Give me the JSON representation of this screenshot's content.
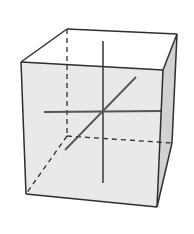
{
  "diagram": {
    "title": "",
    "colors": {
      "background": "#ffffff",
      "front_face": "#e9e9e9",
      "side_face": "#d2d2d2",
      "top_face": "#ffffff",
      "edge": "#2e2e2e",
      "axis": "#555555"
    },
    "vertices": {
      "front_top_left": [
        21,
        62
      ],
      "front_top_right": [
        163,
        70
      ],
      "front_bottom_right": [
        157,
        207
      ],
      "front_bottom_left": [
        26,
        194
      ],
      "back_top_left": [
        67,
        29
      ],
      "back_top_right": [
        177,
        34
      ],
      "back_bottom_right": [
        172,
        143
      ],
      "back_bottom_left": [
        67,
        136
      ]
    },
    "axes": [
      {
        "name": "vertical-axis",
        "from": [
          103,
          41
        ],
        "to": [
          103,
          183
        ]
      },
      {
        "name": "horizontal-axis",
        "from": [
          44,
          112
        ],
        "to": [
          162,
          111
        ]
      },
      {
        "name": "depth-axis",
        "from": [
          65,
          150
        ],
        "to": [
          136,
          77
        ]
      }
    ],
    "center": [
      103,
      111
    ]
  }
}
